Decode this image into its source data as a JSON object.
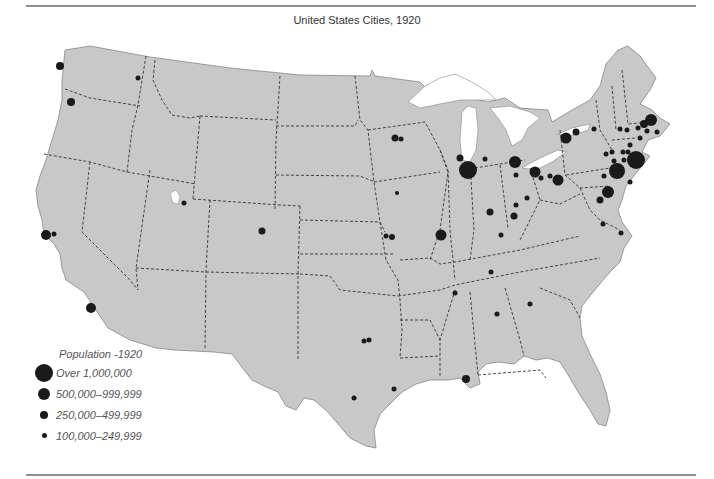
{
  "title": "United States Cities, 1920",
  "colors": {
    "land": "#c8c8c8",
    "border": "#333333",
    "city": "#1a1a1a",
    "water": "#ffffff"
  },
  "legend": {
    "title": "Population -1920",
    "items": [
      {
        "label": "Over 1,000,000",
        "size": 18
      },
      {
        "label": "500,000–999,999",
        "size": 12
      },
      {
        "label": "250,000–499,999",
        "size": 8
      },
      {
        "label": "100,000–249,999",
        "size": 5
      }
    ]
  },
  "cities": [
    {
      "x": 60,
      "y": 66,
      "r": 4
    },
    {
      "x": 138,
      "y": 78,
      "r": 2.5
    },
    {
      "x": 71,
      "y": 102,
      "r": 4
    },
    {
      "x": 46,
      "y": 235,
      "r": 5
    },
    {
      "x": 54,
      "y": 234,
      "r": 2.5
    },
    {
      "x": 91,
      "y": 308,
      "r": 5
    },
    {
      "x": 184,
      "y": 203,
      "r": 2.5
    },
    {
      "x": 262,
      "y": 231,
      "r": 3.5
    },
    {
      "x": 395,
      "y": 138,
      "r": 3.5
    },
    {
      "x": 401,
      "y": 139,
      "r": 2.5
    },
    {
      "x": 397,
      "y": 193,
      "r": 2
    },
    {
      "x": 386,
      "y": 236,
      "r": 2.5
    },
    {
      "x": 392,
      "y": 237,
      "r": 3
    },
    {
      "x": 441,
      "y": 235,
      "r": 5.5
    },
    {
      "x": 460,
      "y": 158,
      "r": 3.5
    },
    {
      "x": 468,
      "y": 170,
      "r": 9
    },
    {
      "x": 485,
      "y": 159,
      "r": 2.5
    },
    {
      "x": 515,
      "y": 162,
      "r": 6
    },
    {
      "x": 516,
      "y": 175,
      "r": 2.5
    },
    {
      "x": 535,
      "y": 172,
      "r": 5.5
    },
    {
      "x": 541,
      "y": 178,
      "r": 2.5
    },
    {
      "x": 550,
      "y": 176,
      "r": 2.5
    },
    {
      "x": 558,
      "y": 180,
      "r": 5.5
    },
    {
      "x": 527,
      "y": 198,
      "r": 2.5
    },
    {
      "x": 516,
      "y": 205,
      "r": 2.5
    },
    {
      "x": 514,
      "y": 216,
      "r": 3.5
    },
    {
      "x": 490,
      "y": 212,
      "r": 3.5
    },
    {
      "x": 501,
      "y": 235,
      "r": 2.5
    },
    {
      "x": 491,
      "y": 272,
      "r": 2.5
    },
    {
      "x": 455,
      "y": 293,
      "r": 2.5
    },
    {
      "x": 497,
      "y": 314,
      "r": 2.5
    },
    {
      "x": 530,
      "y": 304,
      "r": 2.5
    },
    {
      "x": 466,
      "y": 379,
      "r": 4
    },
    {
      "x": 364,
      "y": 341,
      "r": 2.5
    },
    {
      "x": 369,
      "y": 340,
      "r": 2.5
    },
    {
      "x": 394,
      "y": 389,
      "r": 2.5
    },
    {
      "x": 354,
      "y": 398,
      "r": 2.5
    },
    {
      "x": 566,
      "y": 138,
      "r": 5.5
    },
    {
      "x": 576,
      "y": 132,
      "r": 3.5
    },
    {
      "x": 594,
      "y": 129,
      "r": 2.5
    },
    {
      "x": 620,
      "y": 129,
      "r": 2.5
    },
    {
      "x": 606,
      "y": 154,
      "r": 2.5
    },
    {
      "x": 604,
      "y": 176,
      "r": 2.5
    },
    {
      "x": 617,
      "y": 171,
      "r": 8
    },
    {
      "x": 636,
      "y": 160,
      "r": 9
    },
    {
      "x": 608,
      "y": 192,
      "r": 6
    },
    {
      "x": 600,
      "y": 200,
      "r": 3.5
    },
    {
      "x": 603,
      "y": 224,
      "r": 2.5
    },
    {
      "x": 621,
      "y": 233,
      "r": 2.5
    },
    {
      "x": 644,
      "y": 124,
      "r": 4
    },
    {
      "x": 651,
      "y": 120,
      "r": 6
    },
    {
      "x": 638,
      "y": 128,
      "r": 2.5
    },
    {
      "x": 647,
      "y": 131,
      "r": 2.5
    },
    {
      "x": 657,
      "y": 132,
      "r": 2.5
    },
    {
      "x": 640,
      "y": 138,
      "r": 2.5
    },
    {
      "x": 630,
      "y": 145,
      "r": 2.5
    },
    {
      "x": 627,
      "y": 130,
      "r": 2.5
    },
    {
      "x": 628,
      "y": 152,
      "r": 2.5
    },
    {
      "x": 624,
      "y": 160,
      "r": 2.5
    },
    {
      "x": 630,
      "y": 182,
      "r": 2.5
    },
    {
      "x": 614,
      "y": 161,
      "r": 2.5
    },
    {
      "x": 623,
      "y": 152,
      "r": 2.5
    },
    {
      "x": 612,
      "y": 152,
      "r": 2.5
    }
  ]
}
